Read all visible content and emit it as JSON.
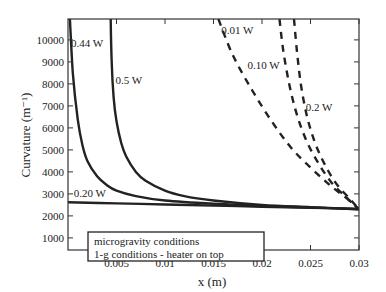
{
  "chart_data": {
    "type": "line",
    "title": "",
    "xlabel": "x (m)",
    "ylabel": "Curvature (m⁻¹)",
    "xlim": [
      0,
      0.03
    ],
    "ylim": [
      450,
      10950
    ],
    "x_ticks": [
      0.005,
      0.01,
      0.015,
      0.02,
      0.025,
      0.03
    ],
    "x_tick_labels": [
      "0.005",
      "0.01",
      "0.015",
      "0.02",
      "0.025",
      "0.03"
    ],
    "y_ticks": [
      1000,
      2000,
      3000,
      4000,
      5000,
      6000,
      7000,
      8000,
      9000,
      10000
    ],
    "y_tick_labels": [
      "1000",
      "2000",
      "3000",
      "4000",
      "5000",
      "6000",
      "7000",
      "8000",
      "9000",
      "10000"
    ],
    "grid": false,
    "legend": {
      "position": "lower-left",
      "entries": [
        "microgravity conditions",
        "1-g conditions - heater on top"
      ]
    },
    "series": [
      {
        "name": "0.44 W",
        "group": "microgravity conditions",
        "style": "solid",
        "x": [
          0.0002,
          0.0005,
          0.001,
          0.0015,
          0.002,
          0.003,
          0.004,
          0.005,
          0.007,
          0.01,
          0.015,
          0.02,
          0.025,
          0.03
        ],
        "y": [
          10950,
          8500,
          6400,
          5200,
          4500,
          3800,
          3400,
          3150,
          2900,
          2700,
          2550,
          2450,
          2380,
          2300
        ]
      },
      {
        "name": "0.5 W",
        "group": "microgravity conditions",
        "style": "solid",
        "x": [
          0.0044,
          0.0045,
          0.0047,
          0.005,
          0.0055,
          0.006,
          0.007,
          0.008,
          0.01,
          0.012,
          0.015,
          0.02,
          0.025,
          0.03
        ],
        "y": [
          10950,
          9000,
          7400,
          6300,
          5300,
          4700,
          4000,
          3600,
          3150,
          2900,
          2700,
          2500,
          2400,
          2300
        ]
      },
      {
        "name": "0.20 W",
        "group": "microgravity conditions",
        "style": "solid",
        "x": [
          0,
          0.005,
          0.01,
          0.015,
          0.02,
          0.025,
          0.03
        ],
        "y": [
          2620,
          2570,
          2520,
          2470,
          2420,
          2370,
          2320
        ]
      },
      {
        "name": "0.01 W",
        "group": "1-g conditions - heater on top",
        "style": "dashed",
        "x": [
          0.0155,
          0.017,
          0.019,
          0.021,
          0.023,
          0.025,
          0.027,
          0.029,
          0.03
        ],
        "y": [
          10950,
          9300,
          7700,
          6300,
          5100,
          4200,
          3400,
          2700,
          2300
        ]
      },
      {
        "name": "0.10 W",
        "group": "1-g conditions - heater on top",
        "style": "dashed",
        "x": [
          0.0218,
          0.0222,
          0.0228,
          0.0236,
          0.0246,
          0.0258,
          0.0272,
          0.0288,
          0.03
        ],
        "y": [
          10950,
          9500,
          8000,
          6600,
          5400,
          4400,
          3500,
          2800,
          2300
        ]
      },
      {
        "name": "0.2 W",
        "group": "1-g conditions - heater on top",
        "style": "dashed",
        "x": [
          0.0233,
          0.0236,
          0.024,
          0.0246,
          0.0254,
          0.0264,
          0.0276,
          0.029,
          0.03
        ],
        "y": [
          10950,
          9500,
          8000,
          6600,
          5400,
          4400,
          3500,
          2800,
          2300
        ]
      }
    ],
    "annotations": [
      {
        "text": "0.44 W",
        "x": 0.0003,
        "y": 9700
      },
      {
        "text": "0.5 W",
        "x": 0.0049,
        "y": 8000
      },
      {
        "text": "0.20 W",
        "x": 0.0006,
        "y": 2850
      },
      {
        "text": "0.01 W",
        "x": 0.0158,
        "y": 10250
      },
      {
        "text": "0.10 W",
        "x": 0.0185,
        "y": 8700
      },
      {
        "text": "0.2 W",
        "x": 0.0245,
        "y": 6750
      }
    ]
  }
}
